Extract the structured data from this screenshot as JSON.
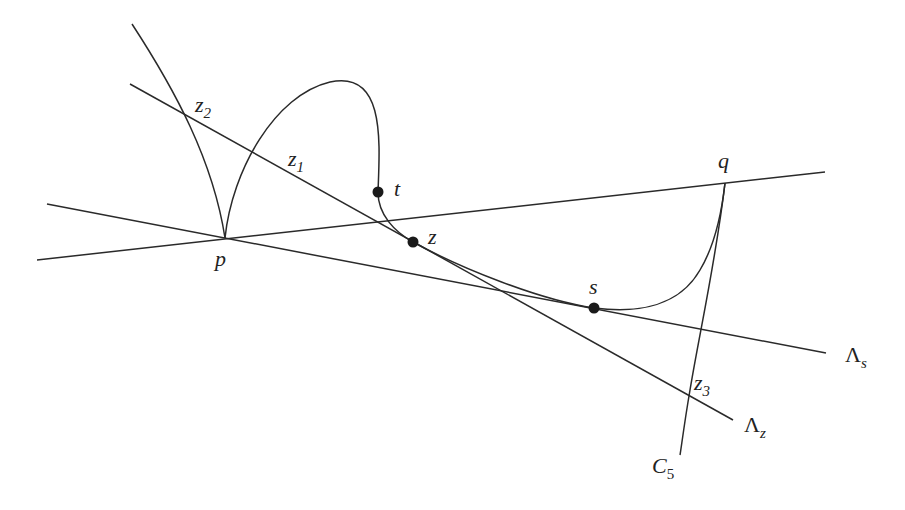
{
  "diagram": {
    "type": "geometric construction",
    "points": {
      "p": {
        "label": "p",
        "x": 225,
        "y": 238
      },
      "q": {
        "label": "q",
        "x": 725,
        "y": 183
      },
      "t": {
        "label": "t",
        "x": 378,
        "y": 192
      },
      "z": {
        "label": "z",
        "x": 413,
        "y": 242
      },
      "s": {
        "label": "s",
        "x": 594,
        "y": 308
      }
    },
    "intersection_labels": {
      "z1": {
        "base": "z",
        "sub": "1"
      },
      "z2": {
        "base": "z",
        "sub": "2"
      },
      "z3": {
        "base": "z",
        "sub": "3"
      }
    },
    "line_labels": {
      "lambda_s": {
        "base": "Λ",
        "sub": "s"
      },
      "lambda_z": {
        "base": "Λ",
        "sub": "z"
      }
    },
    "curve_labels": {
      "c5": {
        "base": "C",
        "sub": "5"
      }
    },
    "colors": {
      "stroke": "#2a2a2a",
      "background": "#ffffff"
    }
  }
}
